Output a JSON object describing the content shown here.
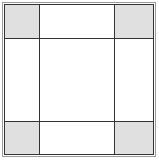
{
  "diagram": {
    "grid": {
      "rows": 3,
      "cols": 3
    },
    "shaded_cells": [
      "top-left",
      "top-right",
      "bottom-left",
      "bottom-right"
    ],
    "colors": {
      "shade": "#e0e0e0",
      "line": "#333333",
      "outer_border": "#9a9a9a",
      "background": "#ffffff"
    }
  }
}
